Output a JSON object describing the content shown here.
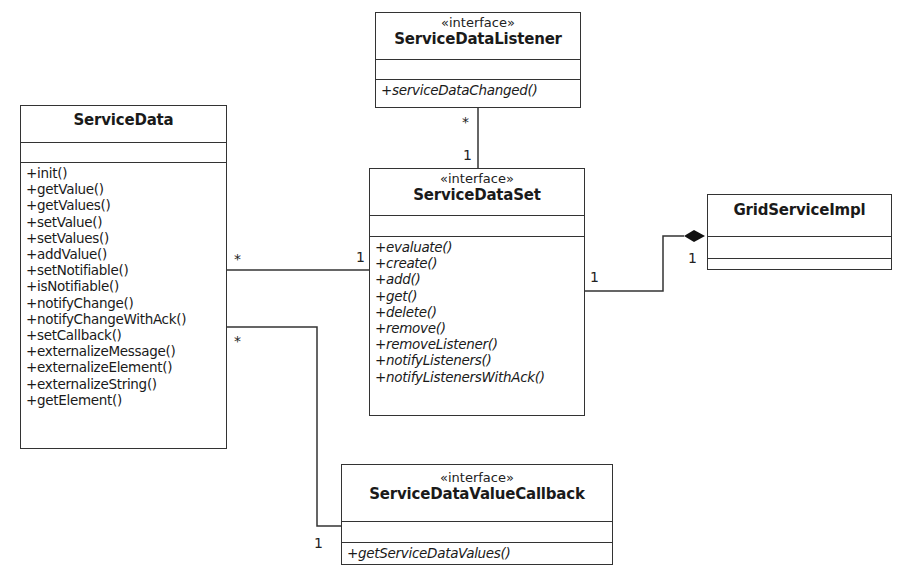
{
  "diagram_type": "UML class diagram",
  "classes": {
    "service_data": {
      "stereotype": "",
      "name": "ServiceData",
      "operations": [
        "+init()",
        "+getValue()",
        "+getValues()",
        "+setValue()",
        "+setValues()",
        "+addValue()",
        "+setNotifiable()",
        "+isNotifiable()",
        "+notifyChange()",
        "+notifyChangeWithAck()",
        "+setCallback()",
        "+externalizeMessage()",
        "+externalizeElement()",
        "+externalizeString()",
        "+getElement()"
      ]
    },
    "service_data_listener": {
      "stereotype": "«interface»",
      "name": "ServiceDataListener",
      "operations": [
        "+serviceDataChanged()"
      ]
    },
    "service_data_set": {
      "stereotype": "«interface»",
      "name": "ServiceDataSet",
      "operations": [
        "+evaluate()",
        "+create()",
        "+add()",
        "+get()",
        "+delete()",
        "+remove()",
        "+removeListener()",
        "+notifyListeners()",
        "+notifyListenersWithAck()"
      ]
    },
    "grid_service_impl": {
      "stereotype": "",
      "name": "GridServiceImpl",
      "operations": []
    },
    "service_data_value_callback": {
      "stereotype": "«interface»",
      "name": "ServiceDataValueCallback",
      "operations": [
        "+getServiceDataValues()"
      ]
    }
  },
  "associations": [
    {
      "from": "ServiceDataListener",
      "to": "ServiceDataSet",
      "from_mult": "*",
      "to_mult": "1",
      "type": "association"
    },
    {
      "from": "ServiceData",
      "to": "ServiceDataSet",
      "from_mult": "*",
      "to_mult": "1",
      "type": "association"
    },
    {
      "from": "ServiceDataSet",
      "to": "GridServiceImpl",
      "from_mult": "1",
      "to_mult": "1",
      "type": "composition"
    },
    {
      "from": "ServiceData",
      "to": "ServiceDataValueCallback",
      "from_mult": "*",
      "to_mult": "1",
      "type": "association"
    }
  ],
  "multiplicities": {
    "listener_end": "*",
    "set_top_end": "1",
    "sd_to_set_sd_end": "*",
    "sd_to_set_set_end": "1",
    "set_to_grid_set_end": "1",
    "set_to_grid_grid_end": "1",
    "sd_to_cb_sd_end": "*",
    "sd_to_cb_cb_end": "1"
  }
}
